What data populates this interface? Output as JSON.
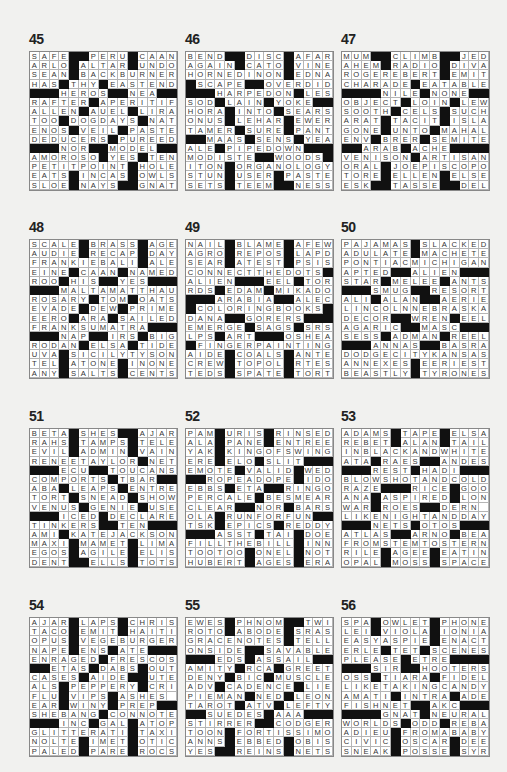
{
  "puzzles": [
    {
      "number": "45",
      "x": 29,
      "y": 51,
      "rows": [
        "SAFE##PERU#CAAN",
        "ARLO#ALTAR#UNDO",
        "SEAN#BACKBURNER",
        "HAS#THY#EASTEND",
        "###HEROS##NEA##",
        "RAFTER#APERITIF",
        "ALLEN#AUEL#LIRA",
        "TOO#DOGDAYS#NAT",
        "ENOS#VEIL#PASTE",
        "DEDUCERS#PUREED",
        "###NOR##MODEL##",
        "AMOROSO#YES#TEN",
        "PETITPOINT#HOLE",
        "EATS#INCAS#OWLS",
        "SLOE#NAYS##GNAT"
      ]
    },
    {
      "number": "46",
      "x": 185,
      "y": 51,
      "rows": [
        "BEND##DISC#AFAR",
        "AGAIN#CATO#VINE",
        "HORNEDINON#EDNA",
        "#SCAPE##OVERDID",
        "###HARPEDON#LES",
        "SOD#LAIN#YOKE##",
        "HORA#INTO#SEARS",
        "ONUS#LEHAR#EWER",
        "TAMER#SURE#PANT",
        "##MAAS#SENS#YEA",
        "ALE#PIPEDOWN###",
        "MODISTE##WOODS#",
        "ITON#ORGANOLOGY",
        "STUN#USER#PASTE",
        "SETS#TEEM##NESS"
      ]
    },
    {
      "number": "47",
      "x": 341,
      "y": 51,
      "rows": [
        "MUM##CLIMB##JED",
        "AHEM#RADIO#DIVA",
        "ROGEREBERT#EMIT",
        "CHARADE#EATABLE",
        "####NILE#NONE##",
        "OBJECT#LOIN#LEW",
        "SOOTH#CELS#SUCH",
        "ARAT#TACIT#ISLA",
        "GONE#UNTO#MAHAL",
        "ENV#BRER#SEMITE",
        "##ARAB#ACHE####",
        "VENISON#ARTISAN",
        "ORAL#JOEPISCOPO",
        "TORE#ELLEN#ELSE",
        "ESK##TASSE##DEL"
      ]
    },
    {
      "number": "48",
      "x": 29,
      "y": 239,
      "rows": [
        "SCALE#BRASS#AGE",
        "AUDIE#RECAP#DAY",
        "FRANKIEBALI#ALE",
        "EINE#CAAN#NAMED",
        "ROO#HIS##YES###",
        "###MALTAMATTHAU",
        "ROSARY#TOM#OATS",
        "EVADE#DEW#PRIME",
        "EERO#ARA#SAILED",
        "FRANKSUMATRA###",
        "###NAP##IRS#BIG",
        "RODAN#ELSA#TIDE",
        "UVA#SICILYTYSON",
        "TEL#ATONE#INONE",
        "ANY#SALTS#CENTS"
      ]
    },
    {
      "number": "49",
      "x": 185,
      "y": 239,
      "rows": [
        "NAIL#BLAME#AFEW",
        "AGRO#REPOS#LAPD",
        "SEAR#ATEST#PSIS",
        "CONNECTTHEDOTS#",
        "ALIEN###EEL#TOR",
        "RDS#EDAM#MIKADO",
        "###ARABIA##ALEC",
        "#COLORINGBOOKS#",
        "DANA##GORERS###",
        "EMERGE#SAGS#SRS",
        "LPS#ART###OSHEA",
        "#FINGERPAINTING",
        "AIDE#COALS#ANTE",
        "CREW#TOPOL#RTES",
        "TEDS#SPATE#TORT"
      ]
    },
    {
      "number": "50",
      "x": 341,
      "y": 239,
      "rows": [
        "PAJAMAS#SLACKED",
        "ADULATE#MACHETE",
        "PONTIACMICHIGAN",
        "APTED##ALIEN###",
        "STAR#MELEE#ANTS",
        "###SMUG##RESORT",
        "ALI#ALAN##AERIE",
        "LINCOLNNEBRASKA",
        "DECOR##WREN#EEL",
        "AGARIC##MASC###",
        "SESS#ADMAN#REEL",
        "###ANNAS##BASRA",
        "DODGECITYKANSAS",
        "ANNEXES#EERIEST",
        "BEASTLY#TYRONES"
      ]
    },
    {
      "number": "51",
      "x": 29,
      "y": 428,
      "rows": [
        "BETA#SHES##AJAR",
        "RAHS#TAMPS#TELE",
        "EVIL#ADMIN#VAIN",
        "RENEETAYLOR#NET",
        "###ECU##TOUCANS",
        "COMPORTS#TBAR##",
        "ABA#LEAPS#ENTRE",
        "TORT#SNEAD#SHOW",
        "VENUS#GENIE#USE",
        "###ICED#DECLARES",
        "TINKERS##TEN###",
        "AMI#KATEJACKSON",
        "MAXI#MAMET#LIMA",
        "EGOS#AGILE#ELIS",
        "DENT##ELLS#TOTS"
      ]
    },
    {
      "number": "52",
      "x": 185,
      "y": 428,
      "rows": [
        "PAM#URIS#RINSED",
        "ALA#PANE#ENTREE",
        "YAK#KINGOFSWING",
        "ERE#ELO#SLIT###",
        "EMOTE#VALID#WED",
        "##ROPEADOPE#IDO",
        "EBBS#ETA##RINGO",
        "PERCALE#BESMEAR",
        "CLEAR##NOR#BARS",
        "OLA#RUNFORFUN##",
        "TSK#EPICS#REDDY",
        "###ASST#TAI#DOE",
        "FILLTHEBILL#INN",
        "TOOTOO#ONEL#NOT",
        "HUBERT#AGES#ERA"
      ]
    },
    {
      "number": "53",
      "x": 341,
      "y": 428,
      "rows": [
        "ADAMS#TAPE#ELSA",
        "REBET#ALAN#TAIL",
        "INBLACKANDWHITE",
        "ATA#RAES##ANDES",
        "###REST#HADI###",
        "BLOWSHOTANDCOLD",
        "RAZE###RICE#GOO",
        "ANA#ASPIRED#LON",
        "WAR#ROES##DERN",
        "LIKENIGHTANDDAY",
        "###NETS#OTOS###",
        "ATLAS##ARNO#BEA",
        "FROMSTEMTOSTERN",
        "RILE#AGEE#EATIN",
        "OPAL#MOSS#SPACE"
      ]
    },
    {
      "number": "54",
      "x": 29,
      "y": 617,
      "rows": [
        "AJAR#LAPS#CHRIS",
        "TACO#EMIT#HAITI",
        "OPUS#VEGEBURGER",
        "NAPE#ENS#ATE###",
        "ENRAGED#FRESCOS",
        "##ETAS#DABS#OUT",
        "CASES#AIDE##UTE",
        "ALS#PEPPERY#CRI",
        "FLU#VIPS#ASHES",
        "EAR#WINY#PREP##",
        "SHEBANG#CONNOTE",
        "###INC#GAL#ATOP",
        "GLITTERATI#TAXI",
        "NOLTE#IMET#OTIC",
        "PALED#PARE#ROCS"
      ]
    },
    {
      "number": "55",
      "x": 185,
      "y": 617,
      "rows": [
        "EWES#PHNOM##TWI",
        "ROTO#ABODE#SRAS",
        "GRACENOTES#TELL",
        "ONSIDE##SAVABLE",
        "###EDS#ASSAIL##",
        "AMITY#RCA#GREET",
        "DENY#BIC#MUSCLE",
        "ADV#CADENCE#LIE",
        "PIEMAN#NED#LEON",
        "TAROT#ATV#LEFTY",
        "##SUEDES#AAA###",
        "STIRRER##CODGER",
        "TOON#FORTISSIMO",
        "ANNS#EBBED#OBIS",
        "YES##REINS#NETS"
      ]
    },
    {
      "number": "56",
      "x": 341,
      "y": 617,
      "rows": [
        "SPA#OWLET#PHONE",
        "LEI#VIOLA#IONIA",
        "EASYASPIE#ENACT",
        "ERLE#TET#SCENES",
        "PLEASE#ETRE####",
        "###SIR##HOOTERS",
        "OSS#TIARA#FIDEL",
        "LIKETAKINGCANDY",
        "AMATI#INTRA#ADE",
        "FISHNET##AKC###",
        "####GNAT#NEURAL",
        "WORLDS#ODD#REBA",
        "ADIEU#FROMABABY",
        "CIVIC#OSCAR#DEE",
        "SNEAK#POSSE#SYR"
      ]
    }
  ]
}
